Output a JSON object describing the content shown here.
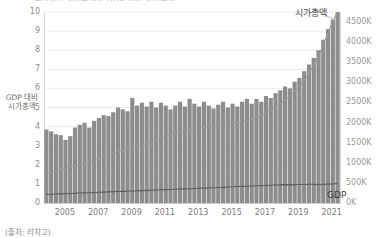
{
  "title_sliver": "주식시장 시가총액과 GDP 대비 시가총액",
  "axes": {
    "left_label": "GDP 대비\n시가총액",
    "left_ticks": [
      "0",
      "1",
      "2",
      "3",
      "4",
      "5",
      "6",
      "7",
      "8",
      "9",
      "10"
    ],
    "right_ticks": [
      "0K",
      "500K",
      "1000K",
      "1500K",
      "2000K",
      "2500K",
      "3000K",
      "3500K",
      "4000K",
      "4500K"
    ],
    "x_ticks": [
      "2005",
      "2007",
      "2009",
      "2011",
      "2013",
      "2015",
      "2017",
      "2019",
      "2021"
    ]
  },
  "annotations": {
    "market_cap": "시가총액",
    "gdp": "GDP"
  },
  "source": "(출처: 리치고)",
  "colors": {
    "bar": "#8d8d8d",
    "line_market_cap": "#9b9b9b",
    "line_gdp": "#5e5e5e",
    "grid": "#ececec",
    "axis": "#d8d8d8"
  },
  "chart_data": {
    "type": "bar",
    "title": "주식시장 시가총액과 GDP 대비 시가총액",
    "xlabel": "",
    "ylabel": "GDP 대비 시가총액",
    "ylim": [
      0,
      10
    ],
    "y2lim": [
      0,
      4750
    ],
    "y2label": "시가총액 (억원)",
    "grid": true,
    "legend_position": "inline-annotation",
    "x_tick_labels": [
      "2005",
      "2007",
      "2009",
      "2011",
      "2013",
      "2015",
      "2017",
      "2019",
      "2021"
    ],
    "x_start_year": 2004.25,
    "x_end_year": 2022.0,
    "bars": {
      "name": "GDP 대비 시가총액 (배)",
      "axis": "left",
      "values": [
        3.85,
        3.75,
        3.6,
        3.55,
        3.3,
        3.5,
        3.95,
        4.1,
        4.2,
        3.95,
        4.3,
        4.45,
        4.6,
        4.55,
        4.75,
        5.0,
        4.9,
        4.8,
        5.5,
        5.1,
        5.25,
        5.05,
        5.3,
        5.0,
        5.25,
        5.1,
        4.9,
        5.1,
        5.3,
        5.05,
        5.45,
        5.2,
        5.05,
        5.3,
        5.1,
        4.95,
        5.15,
        5.3,
        5.0,
        5.2,
        5.05,
        5.3,
        5.45,
        5.2,
        5.45,
        5.3,
        5.6,
        5.5,
        5.75,
        5.9,
        6.1,
        6.0,
        6.35,
        6.55,
        6.9,
        7.25,
        7.6,
        8.0,
        8.55,
        9.1,
        9.6,
        10.0
      ]
    },
    "lines": [
      {
        "name": "시가총액",
        "axis": "left",
        "values": [
          1.55,
          1.6,
          1.65,
          1.72,
          1.8,
          1.9,
          1.95,
          2.0,
          2.1,
          2.15,
          2.2,
          2.3,
          2.45,
          2.5,
          2.6,
          2.7,
          2.8,
          2.85,
          2.95,
          3.0,
          3.05,
          3.1,
          3.2,
          3.3,
          3.4,
          3.5,
          3.6,
          3.68,
          3.75,
          3.85,
          3.9,
          3.9,
          3.95,
          3.95,
          4.0,
          4.0,
          4.05,
          4.1,
          4.1,
          4.15,
          4.2,
          4.25,
          4.3,
          4.4,
          4.5,
          4.6,
          4.75,
          4.9,
          5.05,
          5.2,
          5.4,
          5.6,
          5.85,
          6.1,
          6.4,
          6.8,
          7.2,
          7.7,
          8.3,
          8.9,
          9.5,
          10.0
        ]
      },
      {
        "name": "GDP",
        "axis": "left",
        "values": [
          0.45,
          0.46,
          0.47,
          0.48,
          0.49,
          0.5,
          0.51,
          0.52,
          0.53,
          0.54,
          0.55,
          0.56,
          0.57,
          0.58,
          0.59,
          0.6,
          0.61,
          0.62,
          0.63,
          0.64,
          0.65,
          0.66,
          0.67,
          0.68,
          0.69,
          0.7,
          0.71,
          0.72,
          0.73,
          0.74,
          0.75,
          0.76,
          0.77,
          0.78,
          0.79,
          0.8,
          0.81,
          0.82,
          0.84,
          0.85,
          0.86,
          0.87,
          0.88,
          0.89,
          0.9,
          0.91,
          0.92,
          0.93,
          0.94,
          0.95,
          0.96,
          0.95,
          0.96,
          0.97,
          0.97,
          0.98,
          0.98,
          0.97,
          0.98,
          0.99,
          1.0,
          1.02
        ]
      }
    ]
  }
}
